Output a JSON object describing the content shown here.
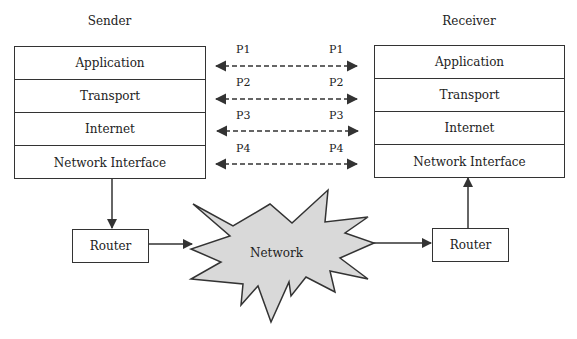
{
  "sender": {
    "title": "Sender",
    "layers": [
      "Application",
      "Transport",
      "Internet",
      "Network Interface"
    ]
  },
  "receiver": {
    "title": "Receiver",
    "layers": [
      "Application",
      "Transport",
      "Internet",
      "Network Interface"
    ]
  },
  "protocols": {
    "left": [
      "P1",
      "P2",
      "P3",
      "P4"
    ],
    "right": [
      "P1",
      "P2",
      "P3",
      "P4"
    ]
  },
  "routers": {
    "left": "Router",
    "right": "Router"
  },
  "network": {
    "label": "Network",
    "fill": "#d9d9d9"
  },
  "colors": {
    "line": "#333333"
  }
}
